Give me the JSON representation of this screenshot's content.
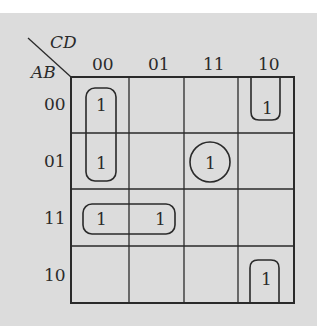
{
  "diagram": {
    "type": "karnaugh-map",
    "row_variable_label": "AB",
    "column_variable_label": "CD",
    "column_headers": [
      "00",
      "01",
      "11",
      "10"
    ],
    "row_headers": [
      "00",
      "01",
      "11",
      "10"
    ],
    "cells": [
      [
        "1",
        "",
        "",
        "1"
      ],
      [
        "1",
        "",
        "1",
        ""
      ],
      [
        "1",
        "1",
        "",
        ""
      ],
      [
        "",
        "",
        "",
        "1"
      ]
    ],
    "groupings": [
      {
        "name": "vertical-pair",
        "cells": [
          [
            0,
            0
          ],
          [
            1,
            0
          ]
        ],
        "shape": "rounded-rect"
      },
      {
        "name": "horizontal-pair",
        "cells": [
          [
            2,
            0
          ],
          [
            2,
            1
          ]
        ],
        "shape": "rounded-rect"
      },
      {
        "name": "single-circle",
        "cells": [
          [
            1,
            2
          ]
        ],
        "shape": "circle"
      },
      {
        "name": "wrap-top",
        "cells": [
          [
            0,
            3
          ]
        ],
        "shape": "open-top-loop"
      },
      {
        "name": "wrap-bottom",
        "cells": [
          [
            3,
            3
          ]
        ],
        "shape": "open-bottom-loop"
      }
    ],
    "colors": {
      "background": "#dcdcdc",
      "line": "#2a2a2a"
    }
  }
}
